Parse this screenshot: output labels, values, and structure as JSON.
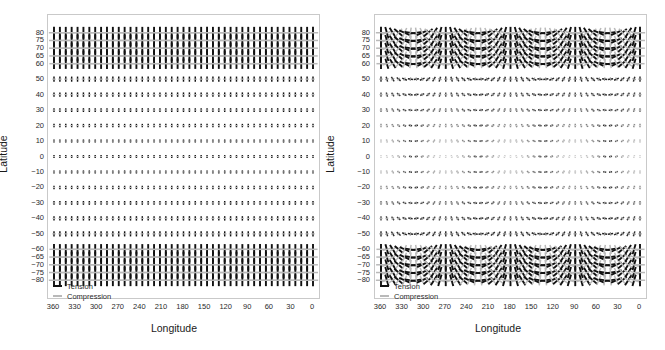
{
  "figure": {
    "axis_titles": {
      "x": "Longitude",
      "y": "Latitude"
    },
    "scale_legend": {
      "prefix": "1 bar or 10",
      "exponent": "5",
      "suffix": " Pa"
    },
    "key_legend": {
      "tension": "Tension",
      "compression": "Compression"
    },
    "colors": {
      "tension": "#111111",
      "compression": "#b9b9b9",
      "frame": "#c9c9c9",
      "text": "#1a1a1a",
      "background": "#ffffff"
    }
  },
  "panels": [
    {
      "tag": "(a)",
      "name": "panel-a"
    },
    {
      "tag": "(b)",
      "name": "panel-b"
    }
  ],
  "chart_data": {
    "type": "scatter",
    "title": "",
    "xlabel": "Longitude",
    "ylabel": "Latitude",
    "xlim": [
      360,
      0
    ],
    "ylim": [
      -85,
      85
    ],
    "x_ticks": [
      360,
      330,
      300,
      270,
      240,
      210,
      180,
      150,
      120,
      90,
      60,
      30,
      0
    ],
    "y_ticks": [
      80,
      75,
      70,
      65,
      60,
      50,
      40,
      30,
      20,
      10,
      0,
      -10,
      -20,
      -30,
      -40,
      -50,
      -60,
      -65,
      -70,
      -75,
      -80
    ],
    "grid": false,
    "legend_position": "bottom-left",
    "series": [
      {
        "name": "Tension",
        "color": "#111111",
        "panel": "(a)",
        "description": "Vertical (north-south oriented) tension bars at every grid node; magnitude largest at high latitudes, smallest near the equator."
      },
      {
        "name": "Compression",
        "color": "#b9b9b9",
        "panel": "(a)",
        "description": "Horizontal (east-west oriented) compression bars at every grid node forming plus-shaped crosses with the tension bars."
      },
      {
        "name": "Tension",
        "color": "#111111",
        "panel": "(b)",
        "description": "Tension bars whose azimuth rotates smoothly with longitude through two full cycles across 0-360 degrees; magnitude largest at high latitudes and fading toward the equator."
      },
      {
        "name": "Compression",
        "color": "#b9b9b9",
        "panel": "(b)",
        "description": "Compression bars perpendicular to the tension bars at each node, faint near the equator."
      }
    ],
    "grid_nodes": {
      "longitude_start": 360,
      "longitude_end": 0,
      "longitude_count": 45,
      "latitudes": [
        80,
        75,
        70,
        65,
        60,
        50,
        40,
        30,
        20,
        10,
        0,
        -10,
        -20,
        -30,
        -40,
        -50,
        -60,
        -65,
        -70,
        -75,
        -80
      ]
    },
    "magnitude_by_latitude": {
      "80": 1.0,
      "75": 0.97,
      "70": 0.94,
      "65": 0.9,
      "60": 0.87,
      "50": 0.6,
      "40": 0.5,
      "30": 0.42,
      "20": 0.36,
      "10": 0.32,
      "0": 0.3,
      "-10": 0.32,
      "-20": 0.36,
      "-30": 0.42,
      "-40": 0.5,
      "-50": 0.6,
      "-60": 0.87,
      "-65": 0.9,
      "-70": 0.94,
      "-75": 0.97,
      "-80": 1.0
    }
  }
}
